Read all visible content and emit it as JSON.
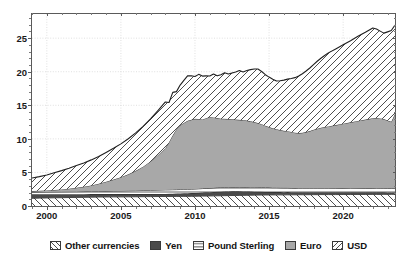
{
  "chart_data": {
    "type": "area",
    "stacked": true,
    "title": "",
    "subtitle": "",
    "xlabel": "",
    "ylabel": "",
    "xlim": [
      1999.0,
      2023.5
    ],
    "ylim": [
      0,
      28.6
    ],
    "grid": true,
    "grid_style": "dotted",
    "legend_position": "bottom",
    "x_ticks": [
      2000,
      2005,
      2010,
      2015,
      2020
    ],
    "x_tick_labels": [
      "2000",
      "2005",
      "2010",
      "2015",
      "2020"
    ],
    "x_minor_interval": 1,
    "y_ticks": [
      0,
      5,
      10,
      15,
      20,
      25
    ],
    "y_tick_labels": [
      "0",
      "5",
      "10",
      "15",
      "20",
      "25"
    ],
    "y_minor_interval": 1,
    "x": [
      1999.0,
      1999.5,
      2000.0,
      2000.5,
      2001.0,
      2001.5,
      2002.0,
      2002.5,
      2003.0,
      2003.5,
      2004.0,
      2004.5,
      2005.0,
      2005.5,
      2006.0,
      2006.5,
      2007.0,
      2007.5,
      2008.0,
      2008.25,
      2008.5,
      2008.75,
      2009.0,
      2009.25,
      2009.5,
      2009.75,
      2010.0,
      2010.25,
      2010.5,
      2010.75,
      2011.0,
      2011.25,
      2011.5,
      2011.75,
      2012.0,
      2012.25,
      2012.5,
      2012.75,
      2013.0,
      2013.25,
      2013.5,
      2013.75,
      2014.0,
      2014.25,
      2014.5,
      2014.75,
      2015.0,
      2015.25,
      2015.5,
      2015.75,
      2016.0,
      2016.25,
      2016.5,
      2016.75,
      2017.0,
      2017.25,
      2017.5,
      2017.75,
      2018.0,
      2018.25,
      2018.5,
      2018.75,
      2019.0,
      2019.5,
      2020.0,
      2020.5,
      2021.0,
      2021.5,
      2022.0,
      2022.25,
      2022.5,
      2022.75,
      2023.0,
      2023.25,
      2023.5
    ],
    "series": [
      {
        "name": "Other currencies",
        "pattern": "diagonal-backslash",
        "color": "#ffffff",
        "values": [
          1.15,
          1.18,
          1.2,
          1.22,
          1.24,
          1.26,
          1.28,
          1.3,
          1.32,
          1.34,
          1.35,
          1.36,
          1.36,
          1.37,
          1.38,
          1.39,
          1.4,
          1.41,
          1.42,
          1.42,
          1.43,
          1.43,
          1.44,
          1.44,
          1.45,
          1.45,
          1.46,
          1.47,
          1.48,
          1.49,
          1.5,
          1.51,
          1.52,
          1.53,
          1.54,
          1.55,
          1.56,
          1.57,
          1.58,
          1.59,
          1.6,
          1.61,
          1.62,
          1.63,
          1.64,
          1.64,
          1.65,
          1.65,
          1.66,
          1.66,
          1.66,
          1.67,
          1.67,
          1.67,
          1.68,
          1.68,
          1.68,
          1.69,
          1.69,
          1.69,
          1.7,
          1.7,
          1.7,
          1.7,
          1.71,
          1.71,
          1.72,
          1.72,
          1.73,
          1.73,
          1.73,
          1.74,
          1.74,
          1.74,
          1.75
        ]
      },
      {
        "name": "Yen",
        "pattern": "solid",
        "color": "#4a4a4a",
        "values": [
          0.6,
          0.58,
          0.56,
          0.54,
          0.52,
          0.5,
          0.48,
          0.46,
          0.45,
          0.44,
          0.43,
          0.42,
          0.41,
          0.4,
          0.39,
          0.38,
          0.38,
          0.38,
          0.38,
          0.39,
          0.4,
          0.42,
          0.44,
          0.45,
          0.46,
          0.47,
          0.48,
          0.5,
          0.52,
          0.54,
          0.56,
          0.58,
          0.6,
          0.61,
          0.62,
          0.62,
          0.62,
          0.61,
          0.6,
          0.58,
          0.56,
          0.54,
          0.52,
          0.5,
          0.48,
          0.46,
          0.44,
          0.43,
          0.42,
          0.41,
          0.4,
          0.4,
          0.39,
          0.39,
          0.38,
          0.38,
          0.38,
          0.37,
          0.37,
          0.37,
          0.36,
          0.36,
          0.36,
          0.35,
          0.35,
          0.34,
          0.34,
          0.33,
          0.32,
          0.31,
          0.3,
          0.29,
          0.28,
          0.28,
          0.27
        ]
      },
      {
        "name": "Pound Sterling",
        "pattern": "horizontal-lines",
        "color": "#ffffff",
        "values": [
          0.32,
          0.33,
          0.34,
          0.35,
          0.36,
          0.37,
          0.38,
          0.39,
          0.4,
          0.42,
          0.44,
          0.46,
          0.48,
          0.5,
          0.52,
          0.54,
          0.56,
          0.58,
          0.6,
          0.6,
          0.6,
          0.59,
          0.58,
          0.58,
          0.58,
          0.58,
          0.59,
          0.59,
          0.6,
          0.6,
          0.61,
          0.61,
          0.62,
          0.62,
          0.63,
          0.63,
          0.64,
          0.64,
          0.65,
          0.65,
          0.66,
          0.66,
          0.67,
          0.67,
          0.67,
          0.66,
          0.66,
          0.65,
          0.65,
          0.64,
          0.64,
          0.63,
          0.62,
          0.61,
          0.6,
          0.6,
          0.6,
          0.6,
          0.6,
          0.6,
          0.6,
          0.6,
          0.6,
          0.6,
          0.61,
          0.61,
          0.62,
          0.62,
          0.62,
          0.62,
          0.62,
          0.62,
          0.62,
          0.62,
          0.62
        ]
      },
      {
        "name": "Euro",
        "pattern": "solid",
        "color": "#a8a8a8",
        "values": [
          0.15,
          0.18,
          0.22,
          0.28,
          0.35,
          0.45,
          0.58,
          0.72,
          0.9,
          1.12,
          1.4,
          1.7,
          2.05,
          2.45,
          2.95,
          3.55,
          4.3,
          5.2,
          6.2,
          7.1,
          8.1,
          9.0,
          9.6,
          9.9,
          10.2,
          10.35,
          10.45,
          10.4,
          10.3,
          10.45,
          10.6,
          10.5,
          10.35,
          10.25,
          10.2,
          10.15,
          10.1,
          10.05,
          10.0,
          9.95,
          9.9,
          9.8,
          9.7,
          9.55,
          9.4,
          9.2,
          9.0,
          8.85,
          8.7,
          8.6,
          8.5,
          8.45,
          8.35,
          8.25,
          8.2,
          8.25,
          8.35,
          8.5,
          8.7,
          8.85,
          9.0,
          9.1,
          9.2,
          9.4,
          9.6,
          9.8,
          10.0,
          10.2,
          10.4,
          10.45,
          10.4,
          10.3,
          10.1,
          9.9,
          11.1
        ]
      },
      {
        "name": "USD",
        "pattern": "diagonal-forward",
        "color": "#ffffff",
        "values": [
          1.95,
          2.1,
          2.3,
          2.55,
          2.8,
          3.05,
          3.3,
          3.55,
          3.8,
          4.05,
          4.35,
          4.65,
          4.95,
          5.3,
          5.65,
          6.0,
          6.35,
          6.65,
          6.9,
          5.9,
          6.4,
          5.6,
          5.95,
          6.35,
          6.7,
          6.55,
          6.3,
          6.65,
          6.45,
          6.3,
          6.1,
          6.45,
          6.3,
          6.55,
          6.85,
          6.7,
          6.9,
          7.1,
          7.35,
          7.2,
          7.45,
          7.7,
          7.9,
          8.05,
          7.85,
          7.6,
          7.45,
          7.3,
          7.2,
          7.35,
          7.55,
          7.75,
          7.95,
          8.2,
          8.5,
          8.8,
          9.1,
          9.4,
          9.7,
          10.05,
          10.35,
          10.65,
          10.95,
          11.35,
          11.75,
          12.15,
          12.6,
          13.0,
          13.45,
          13.25,
          13.0,
          12.8,
          13.2,
          13.6,
          13.2
        ]
      }
    ],
    "total_top_values": [
      4.17,
      4.37,
      4.62,
      4.94,
      5.27,
      5.63,
      6.02,
      6.42,
      6.87,
      7.37,
      7.97,
      8.59,
      9.25,
      10.02,
      10.89,
      11.86,
      13.0,
      14.22,
      15.5,
      15.41,
      16.93,
      17.04,
      18.01,
      19.12,
      20.09,
      19.4,
      19.28,
      19.61,
      19.35,
      19.38,
      19.37,
      19.65,
      19.39,
      19.56,
      19.84,
      19.65,
      19.82,
      19.97,
      20.18,
      19.97,
      20.17,
      20.31,
      20.41,
      20.4,
      20.04,
      19.56,
      19.2,
      18.88,
      18.63,
      18.66,
      18.75,
      18.9,
      18.98,
      19.12,
      19.36,
      19.71,
      20.11,
      20.56,
      21.06,
      21.51,
      22.01,
      22.41,
      22.81,
      23.4,
      24.02,
      24.61,
      25.28,
      25.87,
      26.52,
      26.31,
      25.98,
      25.75,
      25.74,
      25.84,
      26.94
    ]
  },
  "legend": {
    "items": [
      {
        "label": "Other currencies",
        "swatch": "hatch-backslash"
      },
      {
        "label": "Yen",
        "swatch": "solid-dark"
      },
      {
        "label": "Pound Sterling",
        "swatch": "horizontal-lines"
      },
      {
        "label": "Euro",
        "swatch": "solid-gray"
      },
      {
        "label": "USD",
        "swatch": "hatch-forward"
      }
    ]
  },
  "axes": {
    "y_labels": [
      "0",
      "5",
      "10",
      "15",
      "20",
      "25"
    ],
    "x_labels": [
      "2000",
      "2005",
      "2010",
      "2015",
      "2020"
    ]
  },
  "colors": {
    "yen": "#4a4a4a",
    "euro": "#a8a8a8",
    "hatch_line": "#3a3a3a",
    "border": "#5a5a5a",
    "grid": "#d8d8d8",
    "text": "#121212",
    "background": "#ffffff"
  }
}
